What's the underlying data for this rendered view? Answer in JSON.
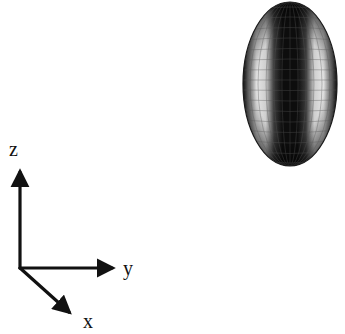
{
  "figure": {
    "type": "3d-ellipsoid-with-coordinate-axes",
    "ellipsoid": {
      "description": "prolate spheroid wireframe mesh, elongated along z",
      "center": [
        290,
        84
      ],
      "radii": [
        47,
        82
      ],
      "colors": {
        "edge": "#1a1a1a",
        "core": "#0d0d0d",
        "highlight": "#f2f2f2",
        "mesh": "#555555"
      }
    },
    "axes": {
      "origin": [
        20,
        268
      ],
      "color": "#111111",
      "items": [
        {
          "name": "z",
          "label": "z",
          "end": [
            20,
            167
          ]
        },
        {
          "name": "y",
          "label": "y",
          "end": [
            118,
            268
          ]
        },
        {
          "name": "x",
          "label": "x",
          "end": [
            73,
            316
          ]
        }
      ]
    }
  }
}
